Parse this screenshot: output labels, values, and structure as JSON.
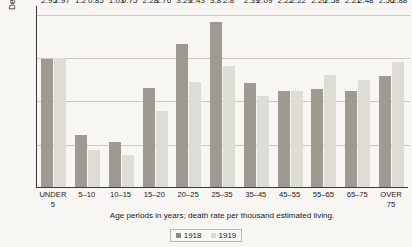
{
  "chart_data": {
    "type": "bar",
    "title": "",
    "xlabel": "Age periods in years; death rate per thousand estimated living.",
    "ylabel": "Deaths per thousand of estimated living",
    "ylim": [
      0,
      4.2
    ],
    "grid": true,
    "gridlines": [
      1.0,
      2.0,
      3.0,
      4.0
    ],
    "legend_position": "bottom",
    "categories": [
      "UNDER\n5",
      "5–10",
      "10–15",
      "15–20",
      "20–25",
      "25–35",
      "35–45",
      "45–55",
      "55–65",
      "65–75",
      "OVER\n75"
    ],
    "series": [
      {
        "name": "1918",
        "color": "#9d9b91",
        "values": [
          2.95,
          1.2,
          1.03,
          2.28,
          3.29,
          3.8,
          2.39,
          2.22,
          2.26,
          2.21,
          2.56
        ]
      },
      {
        "name": "1919",
        "color": "#ddddd6",
        "values": [
          2.97,
          0.85,
          0.75,
          1.76,
          2.43,
          2.8,
          2.09,
          2.22,
          2.58,
          2.48,
          2.88
        ]
      }
    ]
  },
  "legend": {
    "items": [
      {
        "label": "1918",
        "swatch": "s1918"
      },
      {
        "label": "1919",
        "swatch": "s1919"
      }
    ]
  }
}
